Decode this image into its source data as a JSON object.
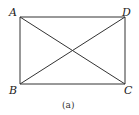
{
  "figure": {
    "caption": "(a)",
    "points": {
      "A": {
        "label": "A",
        "x": 20,
        "y": 17
      },
      "B": {
        "label": "B",
        "x": 20,
        "y": 84
      },
      "C": {
        "label": "C",
        "x": 125,
        "y": 84
      },
      "D": {
        "label": "D",
        "x": 125,
        "y": 17
      }
    },
    "segments": [
      "AD",
      "DC",
      "AB",
      "BC",
      "AC",
      "BD"
    ],
    "line_color": "#333333"
  }
}
